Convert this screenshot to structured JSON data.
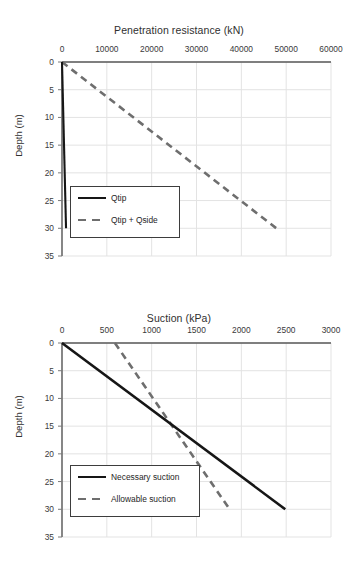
{
  "chart_data": [
    {
      "type": "line",
      "title": "Penetration resistance (kN)",
      "xlabel": "Penetration resistance (kN)",
      "ylabel": "Depth (m)",
      "xlim": [
        0,
        60000
      ],
      "ylim": [
        0,
        35
      ],
      "y_inverted": true,
      "grid": true,
      "legend_position": "lower-left",
      "xticks": [
        "0",
        "10000",
        "20000",
        "30000",
        "40000",
        "50000",
        "60000"
      ],
      "xtick_values": [
        0,
        10000,
        20000,
        30000,
        40000,
        50000,
        60000
      ],
      "yticks": [
        "0",
        "5",
        "10",
        "15",
        "20",
        "25",
        "30",
        "35"
      ],
      "ytick_values": [
        0,
        5,
        10,
        15,
        20,
        25,
        30,
        35
      ],
      "series": [
        {
          "name": "Qtip",
          "style": "solid",
          "color": "#161616",
          "x": [
            0,
            900
          ],
          "y": [
            0,
            30
          ]
        },
        {
          "name": "Qtip + Qside",
          "style": "dashed",
          "color": "#6e6e6e",
          "x": [
            0,
            47800
          ],
          "y": [
            0,
            30
          ]
        }
      ]
    },
    {
      "type": "line",
      "title": "Suction (kPa)",
      "xlabel": "Suction (kPa)",
      "ylabel": "Depth (m)",
      "xlim": [
        0,
        3000
      ],
      "ylim": [
        0,
        35
      ],
      "y_inverted": true,
      "grid": true,
      "legend_position": "lower-left",
      "xticks": [
        "0",
        "500",
        "1000",
        "1500",
        "2000",
        "2500",
        "3000"
      ],
      "xtick_values": [
        0,
        500,
        1000,
        1500,
        2000,
        2500,
        3000
      ],
      "yticks": [
        "0",
        "5",
        "10",
        "15",
        "20",
        "25",
        "30",
        "35"
      ],
      "ytick_values": [
        0,
        5,
        10,
        15,
        20,
        25,
        30,
        35
      ],
      "series": [
        {
          "name": "Necessary suction",
          "style": "solid",
          "color": "#161616",
          "x": [
            0,
            2490
          ],
          "y": [
            0,
            30
          ]
        },
        {
          "name": "Allowable suction",
          "style": "dashed",
          "color": "#6e6e6e",
          "x": [
            590,
            1870
          ],
          "y": [
            0,
            30
          ]
        }
      ]
    }
  ],
  "charts": [
    {
      "id": "penetration-resistance",
      "title": "Penetration resistance (kN)",
      "ylabel": "Depth (m)",
      "xticks": [
        "0",
        "10000",
        "20000",
        "30000",
        "40000",
        "50000",
        "60000"
      ],
      "yticks": [
        "0",
        "5",
        "10",
        "15",
        "20",
        "25",
        "30",
        "35"
      ],
      "legend": [
        {
          "label": "Qtip",
          "style": "solid"
        },
        {
          "label": "Qtip + Qside",
          "style": "dashed"
        }
      ]
    },
    {
      "id": "suction",
      "title": "Suction (kPa)",
      "ylabel": "Depth (m)",
      "xticks": [
        "0",
        "500",
        "1000",
        "1500",
        "2000",
        "2500",
        "3000"
      ],
      "yticks": [
        "0",
        "5",
        "10",
        "15",
        "20",
        "25",
        "30",
        "35"
      ],
      "legend": [
        {
          "label": "Necessary suction",
          "style": "solid"
        },
        {
          "label": "Allowable suction",
          "style": "dashed"
        }
      ]
    }
  ]
}
